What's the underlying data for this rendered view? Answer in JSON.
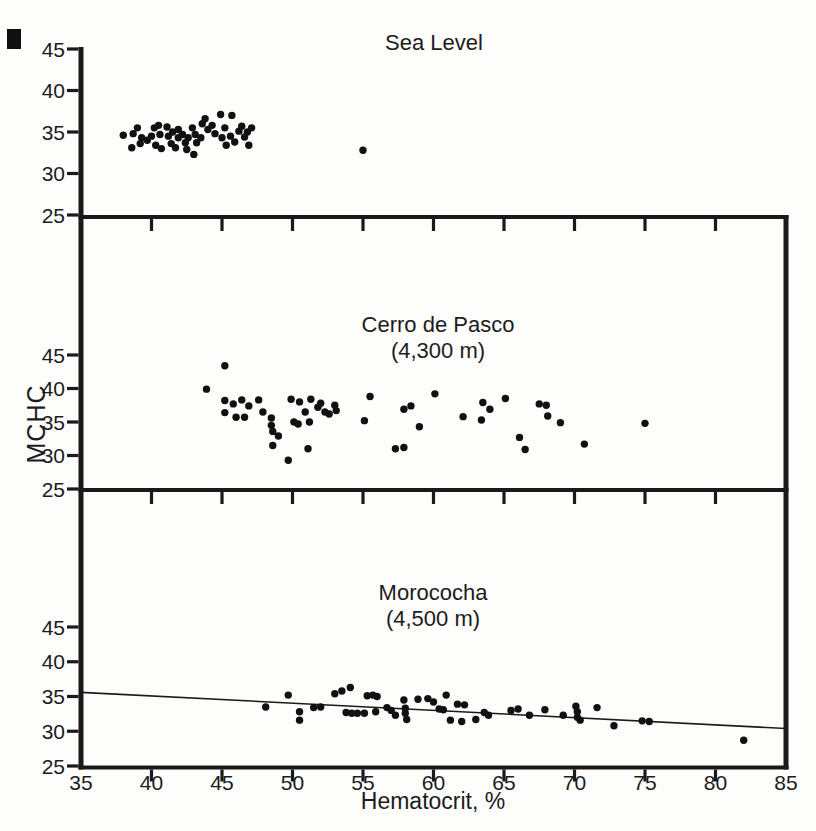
{
  "figure": {
    "y_axis_label": "MCHC",
    "x_axis_label": "Hematocrit, %"
  },
  "chart_data": [
    {
      "type": "scatter",
      "title": "Sea Level",
      "subtitle": "",
      "xlabel": "Hematocrit, %",
      "ylabel": "MCHC",
      "xlim": [
        35,
        85
      ],
      "ylim_labeled": [
        25,
        45
      ],
      "x_ticks": [
        35,
        40,
        45,
        50,
        55,
        60,
        65,
        70,
        75,
        80,
        85
      ],
      "y_ticks": [
        25,
        30,
        35,
        40,
        45
      ],
      "grid": false,
      "marker": "filled-circle",
      "points": [
        [
          38.0,
          34.6
        ],
        [
          38.7,
          34.8
        ],
        [
          38.6,
          33.1
        ],
        [
          39.0,
          35.5
        ],
        [
          39.3,
          34.3
        ],
        [
          39.2,
          33.6
        ],
        [
          39.7,
          34.0
        ],
        [
          40.0,
          34.5
        ],
        [
          40.2,
          35.5
        ],
        [
          40.5,
          35.8
        ],
        [
          40.6,
          34.7
        ],
        [
          40.3,
          33.4
        ],
        [
          40.7,
          33.0
        ],
        [
          41.1,
          35.6
        ],
        [
          41.2,
          34.5
        ],
        [
          41.4,
          33.6
        ],
        [
          41.5,
          35.0
        ],
        [
          41.9,
          35.3
        ],
        [
          41.9,
          34.3
        ],
        [
          41.7,
          33.1
        ],
        [
          42.2,
          34.7
        ],
        [
          42.4,
          33.7
        ],
        [
          42.6,
          34.3
        ],
        [
          42.5,
          32.9
        ],
        [
          42.9,
          35.5
        ],
        [
          43.1,
          34.7
        ],
        [
          43.2,
          33.7
        ],
        [
          43.0,
          32.3
        ],
        [
          43.5,
          34.3
        ],
        [
          43.6,
          36.0
        ],
        [
          43.8,
          36.6
        ],
        [
          44.0,
          35.3
        ],
        [
          44.3,
          35.8
        ],
        [
          44.5,
          34.8
        ],
        [
          44.9,
          37.1
        ],
        [
          45.7,
          37.0
        ],
        [
          45.2,
          35.5
        ],
        [
          45.0,
          34.3
        ],
        [
          45.3,
          33.4
        ],
        [
          45.6,
          34.5
        ],
        [
          45.9,
          33.8
        ],
        [
          46.2,
          35.1
        ],
        [
          46.4,
          35.7
        ],
        [
          46.6,
          34.4
        ],
        [
          46.8,
          35.0
        ],
        [
          47.1,
          35.5
        ],
        [
          46.9,
          33.4
        ],
        [
          55.0,
          32.8
        ]
      ]
    },
    {
      "type": "scatter",
      "title": "Cerro de Pasco",
      "subtitle": "(4,300 m)",
      "xlabel": "Hematocrit, %",
      "ylabel": "MCHC",
      "xlim": [
        35,
        85
      ],
      "ylim_labeled": [
        25,
        45
      ],
      "x_ticks": [
        35,
        40,
        45,
        50,
        55,
        60,
        65,
        70,
        75,
        80,
        85
      ],
      "y_ticks": [
        25,
        30,
        35,
        40,
        45
      ],
      "grid": false,
      "marker": "filled-circle",
      "points": [
        [
          43.9,
          39.9
        ],
        [
          45.2,
          43.4
        ],
        [
          45.2,
          38.2
        ],
        [
          45.2,
          36.4
        ],
        [
          45.8,
          37.7
        ],
        [
          46.4,
          38.3
        ],
        [
          46.0,
          35.7
        ],
        [
          46.6,
          35.7
        ],
        [
          46.9,
          37.4
        ],
        [
          47.6,
          38.3
        ],
        [
          47.9,
          36.5
        ],
        [
          48.5,
          35.6
        ],
        [
          48.5,
          34.5
        ],
        [
          48.6,
          33.6
        ],
        [
          49.0,
          32.9
        ],
        [
          48.6,
          31.5
        ],
        [
          49.7,
          29.3
        ],
        [
          49.9,
          38.4
        ],
        [
          50.5,
          38.0
        ],
        [
          50.1,
          35.0
        ],
        [
          50.4,
          34.7
        ],
        [
          50.9,
          36.5
        ],
        [
          51.3,
          38.4
        ],
        [
          51.2,
          35.0
        ],
        [
          51.8,
          37.2
        ],
        [
          52.0,
          37.8
        ],
        [
          52.3,
          36.5
        ],
        [
          52.6,
          36.2
        ],
        [
          53.0,
          37.5
        ],
        [
          53.1,
          36.7
        ],
        [
          51.1,
          31.0
        ],
        [
          55.5,
          38.8
        ],
        [
          55.1,
          35.2
        ],
        [
          57.3,
          31.0
        ],
        [
          57.9,
          31.2
        ],
        [
          57.9,
          36.9
        ],
        [
          58.4,
          37.4
        ],
        [
          60.1,
          39.2
        ],
        [
          59.0,
          34.3
        ],
        [
          62.1,
          35.8
        ],
        [
          63.5,
          37.9
        ],
        [
          64.0,
          36.9
        ],
        [
          63.4,
          35.3
        ],
        [
          65.1,
          38.5
        ],
        [
          66.1,
          32.7
        ],
        [
          66.5,
          30.9
        ],
        [
          67.5,
          37.7
        ],
        [
          68.0,
          37.5
        ],
        [
          68.1,
          35.9
        ],
        [
          69.0,
          34.9
        ],
        [
          70.7,
          31.7
        ],
        [
          75.0,
          34.8
        ]
      ]
    },
    {
      "type": "scatter",
      "title": "Morococha",
      "subtitle": "(4,500 m)",
      "xlabel": "Hematocrit, %",
      "ylabel": "MCHC",
      "xlim": [
        35,
        85
      ],
      "ylim_labeled": [
        25,
        45
      ],
      "x_ticks": [
        35,
        40,
        45,
        50,
        55,
        60,
        65,
        70,
        75,
        80,
        85
      ],
      "y_ticks": [
        25,
        30,
        35,
        40,
        45
      ],
      "grid": false,
      "marker": "filled-circle",
      "trend_line": {
        "x1": 35,
        "y1": 35.6,
        "x2": 85,
        "y2": 30.4
      },
      "points": [
        [
          48.1,
          33.5
        ],
        [
          49.7,
          35.2
        ],
        [
          50.5,
          32.8
        ],
        [
          50.5,
          31.6
        ],
        [
          51.5,
          33.4
        ],
        [
          52.0,
          33.5
        ],
        [
          53.0,
          35.4
        ],
        [
          53.5,
          35.8
        ],
        [
          54.1,
          36.3
        ],
        [
          53.8,
          32.7
        ],
        [
          54.2,
          32.6
        ],
        [
          54.6,
          32.6
        ],
        [
          55.1,
          32.6
        ],
        [
          55.3,
          35.1
        ],
        [
          55.7,
          35.2
        ],
        [
          56.0,
          35.0
        ],
        [
          55.9,
          32.8
        ],
        [
          56.7,
          33.4
        ],
        [
          57.0,
          33.0
        ],
        [
          57.3,
          32.3
        ],
        [
          57.9,
          34.5
        ],
        [
          58.0,
          33.3
        ],
        [
          58.0,
          32.6
        ],
        [
          58.1,
          31.7
        ],
        [
          58.9,
          34.6
        ],
        [
          59.6,
          34.7
        ],
        [
          60.0,
          34.2
        ],
        [
          60.4,
          33.2
        ],
        [
          60.7,
          33.1
        ],
        [
          60.9,
          35.2
        ],
        [
          61.2,
          31.6
        ],
        [
          61.7,
          33.9
        ],
        [
          62.0,
          31.4
        ],
        [
          62.2,
          33.8
        ],
        [
          63.0,
          31.7
        ],
        [
          63.6,
          32.7
        ],
        [
          63.9,
          32.3
        ],
        [
          65.5,
          33.0
        ],
        [
          66.0,
          33.2
        ],
        [
          66.8,
          32.3
        ],
        [
          67.9,
          33.1
        ],
        [
          69.2,
          32.3
        ],
        [
          70.1,
          33.6
        ],
        [
          70.2,
          32.8
        ],
        [
          70.2,
          32.0
        ],
        [
          70.4,
          31.6
        ],
        [
          71.6,
          33.4
        ],
        [
          72.8,
          30.8
        ],
        [
          74.8,
          31.5
        ],
        [
          75.3,
          31.4
        ],
        [
          82.0,
          28.7
        ]
      ]
    }
  ]
}
